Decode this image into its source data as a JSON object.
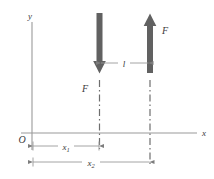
{
  "figure": {
    "type": "force-couple-diagram",
    "background_color": "#ffffff",
    "axes": {
      "x_label": "x",
      "y_label": "y",
      "origin_label": "O",
      "axis_color": "#8a8a8a"
    },
    "forces": [
      {
        "id": "left-force",
        "label": "F",
        "direction": "down",
        "color": "#616161"
      },
      {
        "id": "right-force",
        "label": "F",
        "direction": "up",
        "color": "#616161"
      }
    ],
    "dimensions": [
      {
        "id": "separation",
        "label": "l",
        "sub": ""
      },
      {
        "id": "distance-1",
        "label": "x",
        "sub": "1"
      },
      {
        "id": "distance-2",
        "label": "x",
        "sub": "2"
      }
    ],
    "guide_lines": {
      "style": "dash-dot",
      "color": "#6e6e6e",
      "count": 2
    }
  }
}
